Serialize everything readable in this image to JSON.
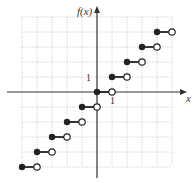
{
  "chart_data": {
    "type": "step",
    "title": "",
    "function": "floor(x)",
    "xlabel": "x",
    "ylabel": "f(x)",
    "xlim": [
      -5,
      5
    ],
    "ylim": [
      -5,
      5
    ],
    "grid": true,
    "grid_style": "dotted",
    "tick_labels": {
      "x": [
        "1"
      ],
      "y": [
        "1"
      ]
    },
    "steps": [
      {
        "y": -5,
        "x_start": -5,
        "x_end": -4,
        "start": "closed",
        "end": "open"
      },
      {
        "y": -4,
        "x_start": -4,
        "x_end": -3,
        "start": "closed",
        "end": "open"
      },
      {
        "y": -3,
        "x_start": -3,
        "x_end": -2,
        "start": "closed",
        "end": "open"
      },
      {
        "y": -2,
        "x_start": -2,
        "x_end": -1,
        "start": "closed",
        "end": "open"
      },
      {
        "y": -1,
        "x_start": -1,
        "x_end": 0,
        "start": "closed",
        "end": "open"
      },
      {
        "y": 0,
        "x_start": 0,
        "x_end": 1,
        "start": "closed",
        "end": "open"
      },
      {
        "y": 1,
        "x_start": 1,
        "x_end": 2,
        "start": "closed",
        "end": "open"
      },
      {
        "y": 2,
        "x_start": 2,
        "x_end": 3,
        "start": "closed",
        "end": "open"
      },
      {
        "y": 3,
        "x_start": 3,
        "x_end": 4,
        "start": "closed",
        "end": "open"
      },
      {
        "y": 4,
        "x_start": 4,
        "x_end": 5,
        "start": "closed",
        "end": "open"
      }
    ]
  },
  "labels": {
    "y_axis": "f(x)",
    "x_axis": "x",
    "x_tick": "1",
    "y_tick": "1"
  },
  "colors": {
    "axis": "#333333",
    "grid": "#b0b0b0",
    "step": "#222222"
  }
}
